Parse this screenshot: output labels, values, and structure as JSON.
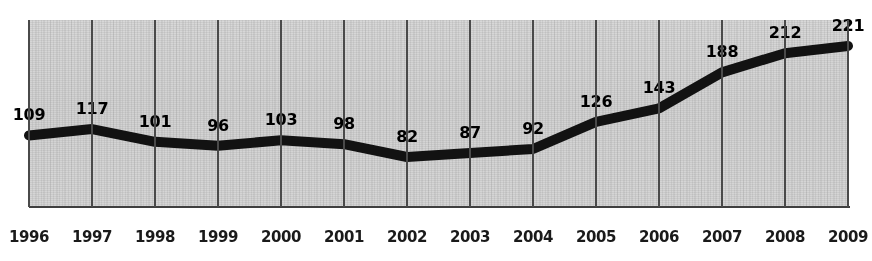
{
  "chart_data": {
    "type": "line",
    "title": "",
    "xlabel": "",
    "ylabel": "",
    "categories": [
      "1996",
      "1997",
      "1998",
      "1999",
      "2000",
      "2001",
      "2002",
      "2003",
      "2004",
      "2005",
      "2006",
      "2007",
      "2008",
      "2009"
    ],
    "values": [
      109,
      117,
      101,
      96,
      103,
      98,
      82,
      87,
      92,
      126,
      143,
      188,
      212,
      221
    ],
    "series": [
      {
        "name": "",
        "values": [
          109,
          117,
          101,
          96,
          103,
          98,
          82,
          87,
          92,
          126,
          143,
          188,
          212,
          221
        ]
      }
    ],
    "point_labels": [
      "109",
      "117",
      "101",
      "96",
      "103",
      "98",
      "82",
      "87",
      "92",
      "126",
      "143",
      "188",
      "212",
      "221"
    ],
    "tick_labels": [
      "1996",
      "1997",
      "1998",
      "1999",
      "2000",
      "2001",
      "2002",
      "2003",
      "2004",
      "2005",
      "2006",
      "2007",
      "2008",
      "2009"
    ],
    "ylim": [
      60,
      235
    ],
    "grid": "vertical-only",
    "legend": "none",
    "line_color": "#121212",
    "grid_color": "#4a4a4a",
    "plot_background": "#e9e9e9",
    "label_color": "#000000"
  }
}
